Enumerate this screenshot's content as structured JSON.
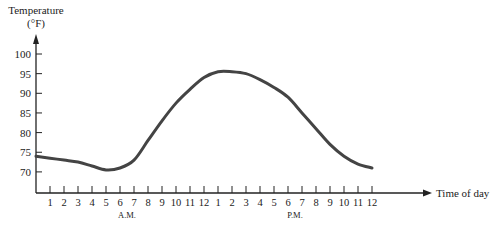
{
  "chart_data": {
    "type": "line",
    "title": "",
    "ylabel": "Temperature",
    "ylabel_unit": "(°F)",
    "xlabel": "Time of day",
    "ylim": [
      65,
      102
    ],
    "yticks": [
      70,
      75,
      80,
      85,
      90,
      95,
      100
    ],
    "xtick_labels": [
      "1",
      "2",
      "3",
      "4",
      "5",
      "6",
      "7",
      "8",
      "9",
      "10",
      "11",
      "12",
      "1",
      "2",
      "3",
      "4",
      "5",
      "6",
      "7",
      "8",
      "9",
      "10",
      "11",
      "12"
    ],
    "period_labels": [
      {
        "label": "A.M.",
        "at_index": 5
      },
      {
        "label": "P.M.",
        "at_index": 17
      }
    ],
    "grid": false,
    "legend": null,
    "series": [
      {
        "name": "Temperature",
        "x_hours": [
          0,
          1,
          2,
          3,
          4,
          5,
          6,
          7,
          8,
          9,
          10,
          11,
          12,
          13,
          14,
          15,
          16,
          17,
          18,
          19,
          20,
          21,
          22,
          23,
          24
        ],
        "values": [
          74,
          73.5,
          73,
          72.5,
          71.5,
          70.5,
          71,
          73,
          78,
          83,
          87.5,
          91,
          94,
          95.5,
          95.5,
          95,
          93.5,
          91.5,
          89,
          85,
          81,
          77,
          74,
          72,
          71
        ]
      }
    ]
  },
  "style": {
    "line_color": "#444444",
    "axis_color": "#222222"
  }
}
